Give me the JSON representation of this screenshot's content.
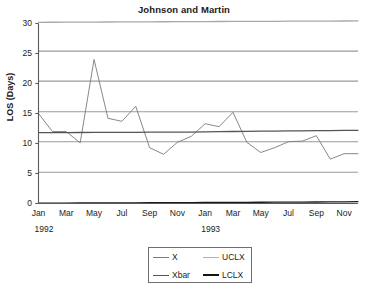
{
  "chart_data": {
    "type": "line",
    "title": "Johnson and Martin",
    "xlabel": "",
    "ylabel": "LOS (Days)",
    "ylim": [
      0,
      30
    ],
    "yticks": [
      0,
      5,
      10,
      15,
      20,
      25,
      30
    ],
    "grid": true,
    "legend_position": "bottom-center",
    "x": [
      "Jan",
      "Feb",
      "Mar",
      "Apr",
      "May",
      "Jun",
      "Jul",
      "Aug",
      "Sep",
      "Oct",
      "Nov",
      "Dec",
      "Jan",
      "Feb",
      "Mar",
      "Apr",
      "May",
      "Jun",
      "Jul",
      "Aug",
      "Sep",
      "Oct",
      "Nov",
      "Dec"
    ],
    "xtick_labels": [
      "Jan",
      "Mar",
      "May",
      "Jul",
      "Sep",
      "Nov",
      "Jan",
      "Mar",
      "May",
      "Jul",
      "Sep",
      "Nov"
    ],
    "year_labels": [
      "1992",
      "1993"
    ],
    "series": [
      {
        "name": "X",
        "color": "#7a7a7a",
        "width": 0.9,
        "values": [
          15.0,
          12.0,
          12.0,
          10.1,
          24.0,
          14.2,
          13.7,
          16.2,
          9.3,
          8.2,
          10.2,
          11.2,
          13.3,
          12.8,
          15.2,
          10.2,
          8.5,
          9.3,
          10.3,
          10.4,
          11.3,
          7.4,
          8.3,
          8.3
        ]
      },
      {
        "name": "UCLX",
        "color": "#a8a8a8",
        "width": 1.3,
        "values": [
          30.2,
          30.21,
          30.22,
          30.23,
          30.24,
          30.25,
          30.26,
          30.27,
          30.28,
          30.29,
          30.3,
          30.31,
          30.32,
          30.33,
          30.34,
          30.35,
          30.36,
          30.37,
          30.38,
          30.39,
          30.4,
          30.41,
          30.42,
          30.45
        ]
      },
      {
        "name": "Xbar",
        "color": "#555555",
        "width": 1.3,
        "values": [
          11.8,
          11.81,
          11.82,
          11.83,
          11.84,
          11.85,
          11.86,
          11.87,
          11.88,
          11.89,
          11.9,
          11.91,
          11.95,
          11.98,
          12.0,
          12.02,
          12.05,
          12.07,
          12.1,
          12.12,
          12.14,
          12.16,
          12.18,
          12.2
        ]
      },
      {
        "name": "LCLX",
        "color": "#1a1a1a",
        "width": 1.3,
        "values": [
          0.05,
          0.06,
          0.07,
          0.08,
          0.09,
          0.1,
          0.11,
          0.12,
          0.13,
          0.14,
          0.15,
          0.16,
          0.17,
          0.18,
          0.19,
          0.2,
          0.21,
          0.22,
          0.23,
          0.24,
          0.25,
          0.26,
          0.27,
          0.3
        ]
      }
    ],
    "reference_lines": [
      {
        "name": "gridline-5",
        "value": 5.2,
        "color": "#9a9a9a"
      },
      {
        "name": "gridline-10",
        "value": 10.3,
        "color": "#9a9a9a"
      },
      {
        "name": "gridline-15",
        "value": 15.3,
        "color": "#9a9a9a"
      },
      {
        "name": "gridline-20",
        "value": 20.4,
        "color": "#9a9a9a"
      },
      {
        "name": "gridline-25",
        "value": 25.4,
        "color": "#9a9a9a"
      }
    ]
  },
  "legend": {
    "items": [
      {
        "label": "X",
        "color": "#7a7a7a",
        "width": 1.1
      },
      {
        "label": "UCLX",
        "color": "#b0b0b0",
        "width": 1.3
      },
      {
        "label": "Xbar",
        "color": "#555555",
        "width": 1.9
      },
      {
        "label": "LCLX",
        "color": "#141414",
        "width": 2.1
      }
    ]
  },
  "axis": {
    "line_color": "#5a5a5a"
  }
}
